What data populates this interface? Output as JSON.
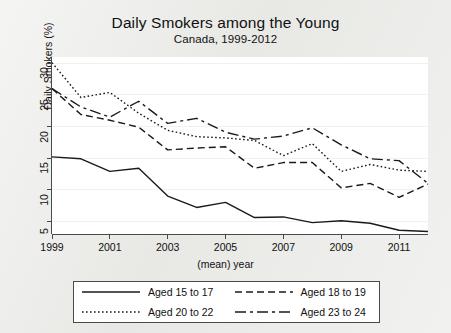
{
  "chart_data": {
    "type": "line",
    "title": "Daily Smokers among the Young",
    "subtitle": "Canada, 1999-2012",
    "xlabel": "(mean) year",
    "ylabel": "Daily Smokers (%)",
    "xlim": [
      1999,
      2012
    ],
    "ylim": [
      3,
      31
    ],
    "grid": true,
    "legend_position": "bottom",
    "x": [
      1999,
      2000,
      2001,
      2002,
      2003,
      2004,
      2005,
      2006,
      2007,
      2008,
      2009,
      2010,
      2011,
      2012
    ],
    "xticks": [
      1999,
      2001,
      2003,
      2005,
      2007,
      2009,
      2011
    ],
    "xtick_labels": [
      "1999",
      "2001",
      "2003",
      "2005",
      "2007",
      "2009",
      "2011"
    ],
    "yticks": [
      5,
      10,
      15,
      20,
      25,
      30
    ],
    "ytick_labels": [
      "5",
      "10",
      "15",
      "20",
      "25",
      "30"
    ],
    "series": [
      {
        "name": "Aged 15 to 17",
        "style": "solid",
        "dasharray": "",
        "values": [
          15.2,
          14.9,
          12.9,
          13.4,
          9.0,
          7.2,
          8.0,
          5.6,
          5.7,
          4.8,
          5.1,
          4.7,
          3.6,
          3.4
        ]
      },
      {
        "name": "Aged 18 to 19",
        "style": "dashed",
        "dasharray": "7,4",
        "values": [
          26.0,
          21.9,
          21.0,
          19.9,
          16.3,
          16.6,
          16.8,
          13.4,
          14.3,
          14.3,
          10.3,
          11.0,
          8.8,
          10.9
        ]
      },
      {
        "name": "Aged 20 to 22",
        "style": "dotted",
        "dasharray": "1.6,2.4",
        "values": [
          30.1,
          24.6,
          25.4,
          22.1,
          19.4,
          18.4,
          18.2,
          17.8,
          15.4,
          17.3,
          12.9,
          14.0,
          13.1,
          12.9
        ]
      },
      {
        "name": "Aged 23 to 24",
        "style": "longdash",
        "dasharray": "11,4,3,4",
        "values": [
          26.0,
          23.1,
          21.5,
          24.0,
          20.5,
          21.3,
          19.1,
          18.0,
          18.5,
          19.8,
          17.1,
          14.9,
          14.6,
          11.0
        ]
      }
    ]
  },
  "legend": {
    "entries": [
      {
        "label": "Aged 15 to 17"
      },
      {
        "label": "Aged 18 to 19"
      },
      {
        "label": "Aged 20 to 22"
      },
      {
        "label": "Aged 23 to 24"
      }
    ]
  }
}
